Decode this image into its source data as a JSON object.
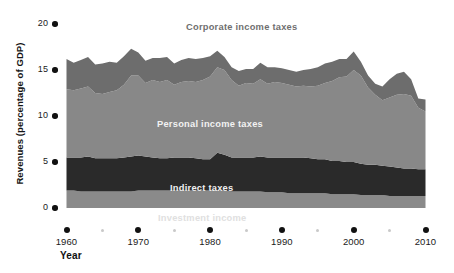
{
  "chart_data": {
    "type": "area",
    "stacked": true,
    "title": "",
    "xlabel": "Year",
    "ylabel": "Revenues (percentage of GDP)",
    "xlim": [
      1960,
      2010
    ],
    "ylim": [
      0,
      20
    ],
    "grid": false,
    "legend_position": "inline-on-bands",
    "x_ticks": [
      1960,
      1970,
      1980,
      1990,
      2000,
      2010
    ],
    "x_minor_ticks": [
      1965,
      1975,
      1985,
      1995,
      2005
    ],
    "y_ticks": [
      0,
      5,
      10,
      15,
      20
    ],
    "x": [
      1960,
      1961,
      1962,
      1963,
      1964,
      1965,
      1966,
      1967,
      1968,
      1969,
      1970,
      1971,
      1972,
      1973,
      1974,
      1975,
      1976,
      1977,
      1978,
      1979,
      1980,
      1981,
      1982,
      1983,
      1984,
      1985,
      1986,
      1987,
      1988,
      1989,
      1990,
      1991,
      1992,
      1993,
      1994,
      1995,
      1996,
      1997,
      1998,
      1999,
      2000,
      2001,
      2002,
      2003,
      2004,
      2005,
      2006,
      2007,
      2008,
      2009,
      2010
    ],
    "series": [
      {
        "name": "Investment income",
        "color": "#8a8a8a",
        "label_color": "#e8e8e8",
        "values": [
          1.9,
          1.9,
          1.8,
          1.8,
          1.8,
          1.8,
          1.8,
          1.8,
          1.8,
          1.8,
          1.9,
          1.9,
          1.9,
          1.9,
          1.9,
          1.9,
          1.9,
          1.9,
          1.9,
          1.9,
          1.9,
          1.9,
          1.9,
          1.8,
          1.8,
          1.8,
          1.8,
          1.8,
          1.7,
          1.7,
          1.7,
          1.6,
          1.6,
          1.6,
          1.6,
          1.6,
          1.6,
          1.5,
          1.5,
          1.5,
          1.5,
          1.4,
          1.4,
          1.4,
          1.4,
          1.3,
          1.3,
          1.3,
          1.3,
          1.3,
          1.3
        ]
      },
      {
        "name": "Indirect taxes",
        "color": "#2a2a2a",
        "label_color": "#f0f0f0",
        "values": [
          3.6,
          3.6,
          3.7,
          3.8,
          3.6,
          3.6,
          3.6,
          3.6,
          3.7,
          3.8,
          3.8,
          3.7,
          3.6,
          3.5,
          3.5,
          3.6,
          3.6,
          3.6,
          3.5,
          3.4,
          3.4,
          4.1,
          3.9,
          3.7,
          3.7,
          3.7,
          3.7,
          3.8,
          3.8,
          3.8,
          3.8,
          3.9,
          3.9,
          3.9,
          3.8,
          3.7,
          3.7,
          3.6,
          3.6,
          3.5,
          3.5,
          3.4,
          3.3,
          3.3,
          3.2,
          3.2,
          3.1,
          3.0,
          3.0,
          2.9,
          2.9
        ]
      },
      {
        "name": "Personal income taxes",
        "color": "#888888",
        "label_color": "#f2f2f2",
        "values": [
          7.4,
          7.3,
          7.5,
          7.6,
          7.1,
          7.0,
          7.2,
          7.4,
          7.9,
          8.8,
          8.7,
          8.0,
          8.4,
          8.3,
          8.5,
          7.9,
          8.2,
          8.3,
          8.3,
          8.6,
          9.0,
          9.3,
          9.2,
          8.4,
          7.8,
          8.1,
          8.0,
          8.4,
          8.0,
          8.2,
          8.1,
          7.9,
          7.7,
          7.8,
          7.8,
          8.0,
          8.3,
          8.7,
          9.1,
          9.3,
          10.0,
          9.6,
          8.4,
          7.6,
          7.1,
          7.5,
          7.9,
          8.1,
          7.9,
          6.7,
          6.3
        ]
      },
      {
        "name": "Corporate income taxes",
        "color": "#6d6d6d",
        "label_color": "#6f6f6f",
        "values": [
          3.3,
          3.0,
          3.1,
          3.2,
          3.1,
          3.3,
          3.3,
          3.0,
          3.1,
          2.9,
          2.5,
          2.4,
          2.4,
          2.6,
          2.5,
          2.3,
          2.4,
          2.5,
          2.5,
          2.4,
          2.2,
          1.8,
          1.4,
          1.4,
          1.6,
          1.5,
          1.6,
          1.8,
          1.8,
          1.6,
          1.6,
          1.6,
          1.6,
          1.7,
          1.9,
          2.0,
          2.1,
          2.1,
          2.0,
          1.9,
          2.0,
          1.5,
          1.3,
          1.2,
          1.5,
          2.0,
          2.3,
          2.4,
          1.8,
          1.0,
          1.3
        ]
      }
    ],
    "series_labels": [
      {
        "text": "Corporate income taxes",
        "x": 186,
        "y": 22,
        "color": "#6f6f6f"
      },
      {
        "text": "Personal income taxes",
        "x": 157,
        "y": 119,
        "color": "#f2f2f2"
      },
      {
        "text": "Indirect taxes",
        "x": 170,
        "y": 183,
        "color": "#f0f0f0"
      },
      {
        "text": "Investment income",
        "x": 158,
        "y": 213,
        "color": "#e0e0e0"
      }
    ]
  }
}
